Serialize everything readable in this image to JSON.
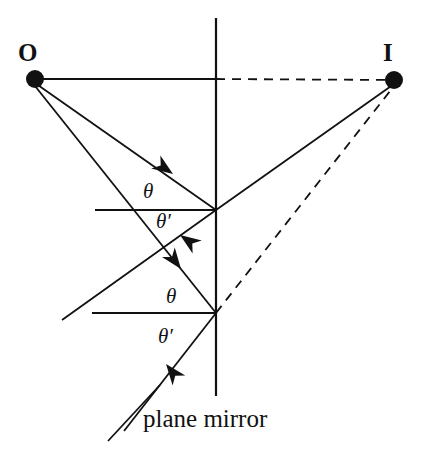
{
  "figure": {
    "background_color": "#ffffff",
    "stroke_color": "#111111"
  },
  "labels": {
    "object_point": "O",
    "image_point": "I",
    "incidence_angle_upper": "θ",
    "reflection_angle_upper": "θ′",
    "incidence_angle_lower": "θ",
    "reflection_angle_lower": "θ′",
    "caption": "plane mirror"
  },
  "chart_data": {
    "type": "diagram",
    "title": "plane mirror",
    "xlabel": "",
    "ylabel": "",
    "xlim": [
      0,
      428
    ],
    "ylim": [
      0,
      459
    ],
    "grid": false,
    "legend": "none",
    "points": [
      {
        "name": "O",
        "label": "O",
        "x": 35,
        "y": 79,
        "marker": "filled-circle",
        "radius": 9
      },
      {
        "name": "I",
        "label": "I",
        "x": 394,
        "y": 80,
        "marker": "filled-circle",
        "radius": 9
      },
      {
        "name": "reflection-point-1",
        "label": "",
        "x": 216,
        "y": 210,
        "marker": "none",
        "radius": 0
      },
      {
        "name": "reflection-point-2",
        "label": "",
        "x": 216,
        "y": 313,
        "marker": "none",
        "radius": 0
      }
    ],
    "segments": [
      {
        "name": "mirror-line",
        "style": "solid",
        "x1": 216,
        "y1": 18,
        "x2": 216,
        "y2": 396
      },
      {
        "name": "axis-O-to-mirror",
        "style": "solid",
        "x1": 35,
        "y1": 79,
        "x2": 216,
        "y2": 79
      },
      {
        "name": "axis-mirror-to-I",
        "style": "dashed",
        "x1": 216,
        "y1": 79,
        "x2": 394,
        "y2": 80
      },
      {
        "name": "incident-ray-1",
        "style": "solid",
        "x1": 35,
        "y1": 83,
        "x2": 216,
        "y2": 210
      },
      {
        "name": "incident-ray-2",
        "style": "solid",
        "x1": 35,
        "y1": 86,
        "x2": 216,
        "y2": 313
      },
      {
        "name": "reflected-ray-1",
        "style": "solid",
        "x1": 216,
        "y1": 210,
        "x2": 62,
        "y2": 320
      },
      {
        "name": "reflected-ray-2",
        "style": "solid",
        "x1": 216,
        "y1": 313,
        "x2": 124,
        "y2": 431
      },
      {
        "name": "normal-line-1",
        "style": "solid",
        "x1": 95,
        "y1": 210,
        "x2": 216,
        "y2": 210
      },
      {
        "name": "normal-line-2",
        "style": "solid",
        "x1": 92,
        "y1": 313,
        "x2": 216,
        "y2": 313
      },
      {
        "name": "virtual-ray-1",
        "style": "solid",
        "x1": 216,
        "y1": 210,
        "x2": 394,
        "y2": 84
      },
      {
        "name": "virtual-ray-2",
        "style": "dashed",
        "x1": 216,
        "y1": 313,
        "x2": 394,
        "y2": 86
      },
      {
        "name": "caption-pointer",
        "style": "solid",
        "x1": 108,
        "y1": 441,
        "x2": 160,
        "y2": 385
      }
    ],
    "arrows": [
      {
        "name": "arrow-incident-1",
        "x": 173,
        "y": 174,
        "angle_deg": 35
      },
      {
        "name": "arrow-reflected-1",
        "x": 180,
        "y": 235,
        "angle_deg": 215
      },
      {
        "name": "arrow-incident-2",
        "x": 181,
        "y": 269,
        "angle_deg": 53
      },
      {
        "name": "arrow-reflected-2",
        "x": 166,
        "y": 364,
        "angle_deg": 232
      }
    ]
  }
}
